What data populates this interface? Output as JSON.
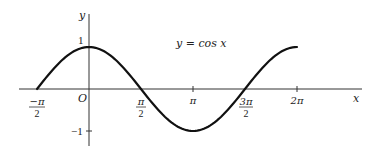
{
  "chart_data": {
    "type": "line",
    "title": "y = cos x",
    "xlabel": "x",
    "ylabel": "y",
    "origin_label": "O",
    "series": [
      {
        "name": "y = cos x",
        "x": [
          -1.5708,
          -0.7854,
          0,
          0.7854,
          1.5708,
          2.3562,
          3.1416,
          3.927,
          4.7124,
          5.4978,
          6.2832
        ],
        "values": [
          0,
          0.7071,
          1,
          0.7071,
          0,
          -0.7071,
          -1,
          -0.7071,
          0,
          0.7071,
          1
        ]
      }
    ],
    "x_ticks": [
      {
        "value": -1.5708,
        "label_num": "−π",
        "label_den": "2"
      },
      {
        "value": 1.5708,
        "label_num": "π",
        "label_den": "2"
      },
      {
        "value": 3.1416,
        "label": "π"
      },
      {
        "value": 4.7124,
        "label_num": "3π",
        "label_den": "2"
      },
      {
        "value": 6.2832,
        "label": "2π"
      }
    ],
    "y_ticks": [
      {
        "value": 1,
        "label": "1"
      },
      {
        "value": -1,
        "label": "−1"
      }
    ],
    "xlim": [
      -2.2,
      8.2
    ],
    "ylim": [
      -1.3,
      1.8
    ],
    "grid": false,
    "legend": "none"
  },
  "labels": {
    "equation": "y = cos x",
    "x_axis": "x",
    "y_axis": "y",
    "origin": "O",
    "tick_neg_half_pi_num": "−π",
    "tick_neg_half_pi_den": "2",
    "tick_half_pi_num": "π",
    "tick_half_pi_den": "2",
    "tick_pi": "π",
    "tick_three_half_pi_num": "3π",
    "tick_three_half_pi_den": "2",
    "tick_two_pi": "2π",
    "y_tick_one": "1",
    "y_tick_neg_one": "−1"
  }
}
